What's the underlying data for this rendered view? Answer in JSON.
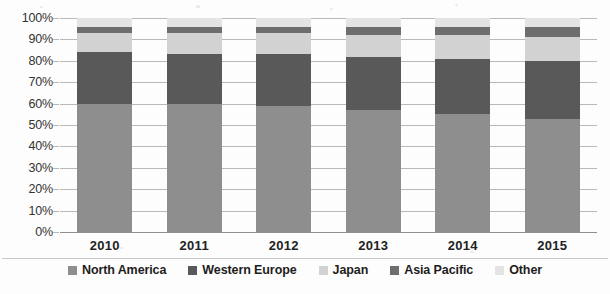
{
  "chart_data": {
    "type": "bar",
    "stacked": true,
    "stack_mode": "percent",
    "title": "",
    "subtitle": "",
    "xlabel": "",
    "ylabel": "",
    "categories": [
      "2010",
      "2011",
      "2012",
      "2013",
      "2014",
      "2015"
    ],
    "ylim": [
      0,
      100
    ],
    "ytick_labels": [
      "0%",
      "10%",
      "20%",
      "30%",
      "40%",
      "50%",
      "60%",
      "70%",
      "80%",
      "90%",
      "100%"
    ],
    "ytick_values": [
      0,
      10,
      20,
      30,
      40,
      50,
      60,
      70,
      80,
      90,
      100
    ],
    "grid": true,
    "grid_axis": "y",
    "legend_position": "bottom",
    "series": [
      {
        "name": "North America",
        "color": "#8e8e8e",
        "values": [
          60,
          60,
          59,
          57,
          55,
          53
        ]
      },
      {
        "name": "Western Europe",
        "color": "#595959",
        "values": [
          24,
          23,
          24,
          25,
          26,
          27
        ]
      },
      {
        "name": "Japan",
        "color": "#d2d2d2",
        "values": [
          9,
          10,
          10,
          10,
          11,
          11
        ]
      },
      {
        "name": "Asia Pacific",
        "color": "#6e6e6e",
        "values": [
          3,
          3,
          3,
          4,
          4,
          5
        ]
      },
      {
        "name": "Other",
        "color": "#e4e4e4",
        "values": [
          4,
          4,
          4,
          4,
          4,
          4
        ]
      }
    ]
  },
  "legend": {
    "items": [
      {
        "label": "North America",
        "color": "#8e8e8e"
      },
      {
        "label": "Western Europe",
        "color": "#595959"
      },
      {
        "label": "Japan",
        "color": "#d2d2d2"
      },
      {
        "label": "Asia Pacific",
        "color": "#6e6e6e"
      },
      {
        "label": "Other",
        "color": "#e4e4e4"
      }
    ]
  },
  "style": {
    "background": "#fdfdfd",
    "gridline_color": "#b9b9b9",
    "baseline_color": "#8f8f8f",
    "text_color": "#222222"
  }
}
